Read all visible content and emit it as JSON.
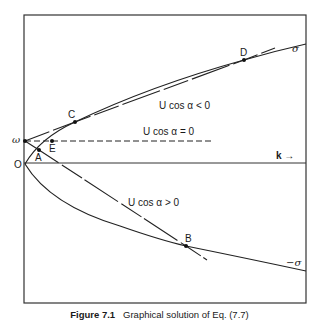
{
  "figure": {
    "caption_prefix": "Figure 7.1",
    "caption_text": "Graphical solution of Eq. (7.7)",
    "axis": {
      "k_label": "k →",
      "omega_label": "ω",
      "origin_label": "O"
    },
    "curves": {
      "sigma_label": "σ",
      "neg_sigma_label": "−σ"
    },
    "lines": {
      "neg_label": "U cos α < 0",
      "zero_label": "U cos α = 0",
      "pos_label": "U cos α > 0"
    },
    "points": {
      "A": "A",
      "B": "B",
      "C": "C",
      "D": "D",
      "E": "E"
    }
  }
}
